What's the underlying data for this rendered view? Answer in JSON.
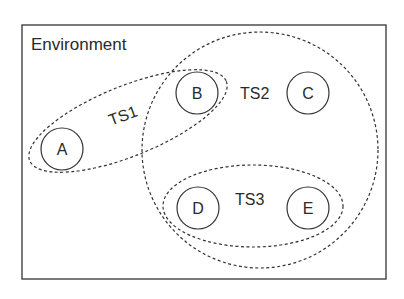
{
  "diagram": {
    "environment": {
      "label": "Environment",
      "x": 22,
      "y": 25,
      "w": 364,
      "h": 254
    },
    "nodes": [
      {
        "id": "A",
        "label": "A",
        "cx": 62,
        "cy": 149,
        "r": 21
      },
      {
        "id": "B",
        "label": "B",
        "cx": 197,
        "cy": 93,
        "r": 21
      },
      {
        "id": "C",
        "label": "C",
        "cx": 308,
        "cy": 93,
        "r": 21
      },
      {
        "id": "D",
        "label": "D",
        "cx": 198,
        "cy": 208,
        "r": 21
      },
      {
        "id": "E",
        "label": "E",
        "cx": 308,
        "cy": 208,
        "r": 21
      }
    ],
    "groups": [
      {
        "id": "TS1",
        "label": "TS1",
        "members": [
          "A",
          "B"
        ]
      },
      {
        "id": "TS2",
        "label": "TS2",
        "members": [
          "B",
          "C",
          "D",
          "E"
        ]
      },
      {
        "id": "TS3",
        "label": "TS3",
        "members": [
          "D",
          "E"
        ]
      }
    ],
    "colors": {
      "stroke": "#333333",
      "background": "#ffffff"
    }
  }
}
